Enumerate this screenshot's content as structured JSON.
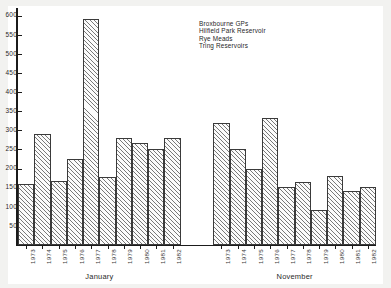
{
  "chart_data": {
    "type": "bar",
    "title": "",
    "subtitle": "",
    "xlabel": "",
    "ylabel": "",
    "ylim": [
      0,
      620
    ],
    "yticks": [
      50,
      100,
      150,
      200,
      250,
      300,
      350,
      400,
      450,
      500,
      550,
      600
    ],
    "ytick_labels": [
      "50",
      "100",
      "150",
      "200",
      "250",
      "300",
      "350",
      "400",
      "450",
      "500",
      "550",
      "600"
    ],
    "grid": false,
    "legend_position": "upper-center-right",
    "legend": [
      "Broxbourne GPs",
      "Hilfield Park Reservoir",
      "Rye Meads",
      "Tring Reservoirs"
    ],
    "groups": [
      {
        "name": "January",
        "categories": [
          "1973",
          "1974",
          "1975",
          "1976",
          "1977",
          "1978",
          "1979",
          "1980",
          "1981",
          "1982"
        ],
        "values": [
          160,
          290,
          168,
          226,
          592,
          178,
          279,
          268,
          252,
          281
        ]
      },
      {
        "name": "November",
        "categories": [
          "1973",
          "1974",
          "1975",
          "1976",
          "1977",
          "1978",
          "1979",
          "1980",
          "1981",
          "1982"
        ],
        "values": [
          320,
          250,
          200,
          331,
          152,
          164,
          92,
          180,
          142,
          152
        ]
      }
    ],
    "colors": {
      "background": "#f2f2f0",
      "plot_background": "#ffffff",
      "axis": "#1b1b1b",
      "bar_edge": "#3a3a3a",
      "bar_hatch": "#464646",
      "text": "#2a2a2a"
    }
  }
}
